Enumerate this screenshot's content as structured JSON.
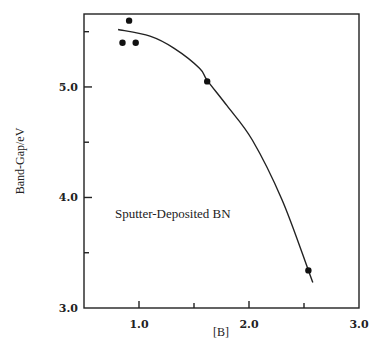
{
  "chart_data": {
    "type": "scatter",
    "title": "",
    "xlabel": "[B]",
    "ylabel": "Band-Gap/eV",
    "xlim": [
      0.5,
      3.0
    ],
    "ylim": [
      3.0,
      5.66
    ],
    "xticks": [
      {
        "value": 1.0,
        "label": "1.0"
      },
      {
        "value": 1.5,
        "label": ""
      },
      {
        "value": 2.0,
        "label": "2.0"
      },
      {
        "value": 2.5,
        "label": ""
      },
      {
        "value": 3.0,
        "label": "3.0"
      }
    ],
    "yticks": [
      {
        "value": 3.0,
        "label": "3.0"
      },
      {
        "value": 3.5,
        "label": ""
      },
      {
        "value": 4.0,
        "label": "4.0"
      },
      {
        "value": 4.5,
        "label": ""
      },
      {
        "value": 5.0,
        "label": "5.0"
      },
      {
        "value": 5.5,
        "label": ""
      }
    ],
    "grid": false,
    "series": [
      {
        "name": "measured",
        "kind": "points",
        "x": [
          0.91,
          0.85,
          0.97,
          1.62,
          2.54
        ],
        "y": [
          5.6,
          5.4,
          5.4,
          5.05,
          3.34
        ]
      },
      {
        "name": "fit",
        "kind": "curve",
        "x": [
          0.81,
          1.1,
          1.32,
          1.55,
          1.62,
          1.8,
          2.03,
          2.3,
          2.54,
          2.58
        ],
        "y": [
          5.52,
          5.46,
          5.35,
          5.17,
          5.06,
          4.83,
          4.52,
          3.98,
          3.34,
          3.23
        ]
      }
    ],
    "annotations": [
      {
        "text": "Sputter-Deposited BN",
        "x": 0.78,
        "y": 3.85
      }
    ]
  }
}
